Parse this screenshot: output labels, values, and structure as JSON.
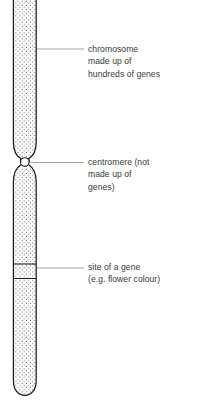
{
  "figure": {
    "background_color": "#ffffff",
    "outline_color": "#1a1a1a",
    "fill_color": "#ffffff",
    "stipple_color": "#555555",
    "leader_line_color": "#9a9a9a",
    "text_color": "#3a3a3a"
  },
  "chromosome": {
    "upper_arm_label": "upper arm",
    "lower_arm_label": "lower arm",
    "centromere_label": "centromere",
    "gene_band_label": "gene site band"
  },
  "annotations": [
    {
      "id": "chromosome",
      "lines": [
        "chromosome",
        "made up of",
        "hundreds of genes"
      ]
    },
    {
      "id": "centromere",
      "lines": [
        "centromere (not",
        "made up of",
        "genes)"
      ]
    },
    {
      "id": "gene-site",
      "lines": [
        "site of a gene",
        "(e.g. flower colour)"
      ]
    }
  ]
}
